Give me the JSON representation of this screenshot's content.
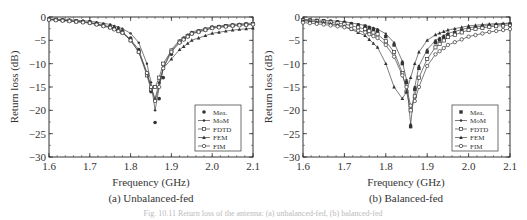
{
  "figure": {
    "caption": "Fig. 10.11 Return loss of the antenna: (a) unbalanced-fed, (b) balanced-fed"
  },
  "chart_data": [
    {
      "type": "line",
      "id": "a",
      "title": "(a) Unbalanced-fed",
      "xlabel": "Frequency (GHz)",
      "ylabel": "Return loss (dB)",
      "xlim": [
        1.6,
        2.1
      ],
      "ylim": [
        -30,
        0
      ],
      "xticks": [
        "1.6",
        "1.7",
        "1.8",
        "1.9",
        "2.0",
        "2.1"
      ],
      "yticks": [
        "0",
        "-5",
        "-10",
        "-15",
        "-20",
        "-25",
        "-30"
      ],
      "grid": false,
      "legend_position": "lower right",
      "x": [
        1.6,
        1.65,
        1.7,
        1.75,
        1.78,
        1.8,
        1.82,
        1.84,
        1.85,
        1.86,
        1.87,
        1.88,
        1.9,
        1.92,
        1.95,
        2.0,
        2.05,
        2.1
      ],
      "series": [
        {
          "name": "Mea.",
          "marker": "filled-circle",
          "line": false,
          "values": [
            -0.5,
            -0.7,
            -1.0,
            -2.0,
            -3.0,
            -4.5,
            -7.0,
            -12.0,
            -16.0,
            -22.6,
            -17.5,
            -13.0,
            -8.0,
            -5.5,
            -3.5,
            -2.2,
            -1.7,
            -1.4
          ]
        },
        {
          "name": "MoM",
          "marker": "filled-dot",
          "line": true,
          "values": [
            -0.4,
            -0.6,
            -0.9,
            -1.6,
            -2.5,
            -3.5,
            -5.5,
            -10.0,
            -14.0,
            -20.0,
            -15.0,
            -11.0,
            -7.0,
            -5.0,
            -3.2,
            -2.1,
            -1.6,
            -1.3
          ]
        },
        {
          "name": "FDTD",
          "marker": "open-square",
          "line": true,
          "values": [
            -0.5,
            -0.8,
            -1.2,
            -2.2,
            -3.3,
            -5.0,
            -7.5,
            -12.5,
            -15.5,
            -15.0,
            -13.0,
            -10.0,
            -7.2,
            -5.3,
            -3.5,
            -2.3,
            -1.8,
            -1.5
          ]
        },
        {
          "name": "FEM",
          "marker": "filled-triangle",
          "line": true,
          "values": [
            -0.5,
            -0.8,
            -1.2,
            -2.1,
            -3.2,
            -4.8,
            -7.0,
            -12.0,
            -15.0,
            -17.5,
            -14.0,
            -11.0,
            -9.0,
            -7.0,
            -5.0,
            -3.5,
            -2.8,
            -2.4
          ]
        },
        {
          "name": "FIM",
          "marker": "open-circle",
          "line": true,
          "values": [
            -0.6,
            -0.9,
            -1.3,
            -2.3,
            -3.4,
            -5.0,
            -7.5,
            -12.0,
            -15.0,
            -18.0,
            -15.0,
            -11.0,
            -7.5,
            -5.5,
            -3.6,
            -2.4,
            -1.9,
            -1.6
          ]
        }
      ]
    },
    {
      "type": "line",
      "id": "b",
      "title": "(b) Balanced-fed",
      "xlabel": "Frequency (GHz)",
      "ylabel": "Return loss (dB)",
      "xlim": [
        1.6,
        2.1
      ],
      "ylim": [
        -30,
        0
      ],
      "xticks": [
        "1.6",
        "1.7",
        "1.8",
        "1.9",
        "2.0",
        "2.1"
      ],
      "yticks": [
        "0",
        "-5",
        "-10",
        "-15",
        "-20",
        "-25",
        "-30"
      ],
      "grid": false,
      "legend_position": "lower right",
      "x": [
        1.6,
        1.65,
        1.7,
        1.75,
        1.78,
        1.8,
        1.82,
        1.84,
        1.85,
        1.86,
        1.87,
        1.88,
        1.9,
        1.92,
        1.95,
        2.0,
        2.05,
        2.1
      ],
      "series": [
        {
          "name": "Mea.",
          "marker": "filled-square",
          "line": false,
          "values": [
            -0.6,
            -0.8,
            -1.2,
            -2.0,
            -3.0,
            -4.2,
            -6.0,
            -10.0,
            -14.0,
            -23.5,
            -15.5,
            -11.0,
            -7.5,
            -5.5,
            -3.8,
            -2.5,
            -1.9,
            -1.5
          ]
        },
        {
          "name": "MoM",
          "marker": "filled-dot",
          "line": true,
          "values": [
            -0.5,
            -0.7,
            -1.0,
            -1.8,
            -2.6,
            -3.6,
            -5.5,
            -9.5,
            -13.5,
            -23.0,
            -15.0,
            -10.5,
            -7.0,
            -5.0,
            -3.5,
            -2.3,
            -1.8,
            -1.4
          ]
        },
        {
          "name": "FDTD",
          "marker": "open-square",
          "line": true,
          "values": [
            -0.7,
            -1.0,
            -1.5,
            -2.6,
            -3.7,
            -5.2,
            -7.5,
            -12.0,
            -16.0,
            -20.0,
            -17.0,
            -13.0,
            -9.0,
            -6.5,
            -4.3,
            -2.8,
            -2.1,
            -1.7
          ]
        },
        {
          "name": "FEM",
          "marker": "filled-triangle",
          "line": true,
          "values": [
            -0.8,
            -1.2,
            -2.0,
            -4.0,
            -6.5,
            -10.0,
            -15.0,
            -17.5,
            -16.0,
            -13.0,
            -10.0,
            -7.5,
            -5.0,
            -3.8,
            -2.8,
            -1.9,
            -1.5,
            -1.3
          ]
        },
        {
          "name": "FIM",
          "marker": "open-circle",
          "line": true,
          "values": [
            -1.2,
            -1.6,
            -2.2,
            -3.3,
            -4.5,
            -6.0,
            -8.5,
            -12.5,
            -15.0,
            -19.0,
            -18.0,
            -15.0,
            -10.5,
            -8.0,
            -6.0,
            -4.2,
            -3.2,
            -2.6
          ]
        }
      ]
    }
  ]
}
